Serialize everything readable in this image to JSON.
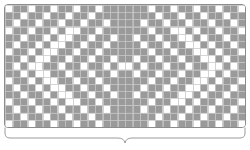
{
  "figure": {
    "kind": "stitch-chart",
    "title": "",
    "caption": "",
    "colors": {
      "filled": "#9a9a9a",
      "empty": "#ffffff",
      "gridline": "#c8c8c8",
      "frame_border": "#8c8c8c",
      "brace": "#9a9a9a"
    }
  },
  "chart_data": {
    "type": "heatmap",
    "title": "",
    "xlabel": "",
    "ylabel": "",
    "columns": 32,
    "rows": 17,
    "legend": [
      {
        "key": "1",
        "label": "filled stitch",
        "color": "#9a9a9a"
      },
      {
        "key": "0",
        "label": "empty stitch",
        "color": "#ffffff"
      }
    ],
    "grid": true,
    "symmetry": "horizontal-mirror-about-center",
    "values": [
      [
        0,
        1,
        1,
        0,
        1,
        1,
        0,
        1,
        1,
        0,
        1,
        1,
        0,
        1,
        1,
        1,
        1,
        1,
        1,
        0,
        1,
        1,
        0,
        1,
        1,
        0,
        1,
        1,
        0,
        1,
        1,
        0
      ],
      [
        1,
        1,
        0,
        1,
        1,
        0,
        1,
        1,
        0,
        1,
        1,
        0,
        1,
        1,
        1,
        1,
        1,
        1,
        1,
        1,
        0,
        1,
        1,
        0,
        1,
        1,
        0,
        1,
        1,
        0,
        1,
        1
      ],
      [
        1,
        0,
        1,
        1,
        0,
        1,
        1,
        0,
        1,
        1,
        0,
        1,
        1,
        0,
        1,
        1,
        1,
        1,
        0,
        1,
        1,
        0,
        1,
        1,
        0,
        1,
        1,
        0,
        1,
        1,
        0,
        1
      ],
      [
        0,
        1,
        1,
        0,
        1,
        1,
        0,
        1,
        0,
        0,
        1,
        1,
        0,
        1,
        1,
        1,
        1,
        1,
        1,
        0,
        1,
        1,
        0,
        0,
        1,
        0,
        1,
        1,
        0,
        1,
        1,
        0
      ],
      [
        1,
        1,
        0,
        1,
        1,
        0,
        1,
        0,
        0,
        1,
        1,
        0,
        1,
        1,
        0,
        1,
        1,
        0,
        1,
        1,
        0,
        1,
        1,
        0,
        0,
        1,
        0,
        1,
        1,
        0,
        1,
        1
      ],
      [
        1,
        0,
        1,
        1,
        0,
        1,
        0,
        0,
        1,
        1,
        0,
        1,
        1,
        0,
        1,
        1,
        1,
        1,
        0,
        1,
        1,
        0,
        1,
        1,
        0,
        0,
        1,
        0,
        1,
        1,
        0,
        1
      ],
      [
        0,
        1,
        1,
        0,
        1,
        0,
        0,
        1,
        1,
        0,
        1,
        1,
        0,
        1,
        1,
        1,
        1,
        1,
        1,
        0,
        1,
        1,
        0,
        1,
        1,
        0,
        0,
        1,
        0,
        1,
        1,
        0
      ],
      [
        1,
        1,
        0,
        1,
        0,
        0,
        1,
        1,
        0,
        1,
        1,
        0,
        1,
        1,
        0,
        1,
        1,
        0,
        1,
        1,
        0,
        1,
        1,
        0,
        1,
        1,
        0,
        0,
        1,
        0,
        1,
        1
      ],
      [
        1,
        0,
        1,
        0,
        0,
        1,
        1,
        0,
        1,
        1,
        0,
        1,
        1,
        0,
        1,
        0,
        0,
        1,
        0,
        1,
        1,
        0,
        1,
        1,
        0,
        1,
        1,
        0,
        0,
        1,
        0,
        1
      ],
      [
        1,
        1,
        0,
        1,
        0,
        0,
        1,
        1,
        0,
        1,
        1,
        0,
        1,
        1,
        0,
        1,
        1,
        0,
        1,
        1,
        0,
        1,
        1,
        0,
        1,
        1,
        0,
        0,
        1,
        0,
        1,
        1
      ],
      [
        0,
        1,
        1,
        0,
        1,
        0,
        0,
        1,
        1,
        0,
        1,
        1,
        0,
        1,
        1,
        1,
        1,
        1,
        1,
        0,
        1,
        1,
        0,
        1,
        1,
        0,
        0,
        1,
        0,
        1,
        1,
        0
      ],
      [
        1,
        0,
        1,
        1,
        0,
        1,
        0,
        0,
        1,
        1,
        0,
        1,
        1,
        0,
        1,
        1,
        1,
        1,
        0,
        1,
        1,
        0,
        1,
        1,
        0,
        0,
        1,
        0,
        1,
        1,
        0,
        1
      ],
      [
        1,
        1,
        0,
        1,
        1,
        0,
        1,
        0,
        0,
        1,
        1,
        0,
        1,
        1,
        0,
        1,
        1,
        0,
        1,
        1,
        0,
        1,
        1,
        0,
        0,
        1,
        0,
        1,
        1,
        0,
        1,
        1
      ],
      [
        0,
        1,
        1,
        0,
        1,
        1,
        0,
        1,
        0,
        0,
        1,
        1,
        0,
        1,
        1,
        1,
        1,
        1,
        1,
        0,
        1,
        1,
        0,
        0,
        1,
        0,
        1,
        1,
        0,
        1,
        1,
        0
      ],
      [
        1,
        0,
        1,
        1,
        0,
        1,
        1,
        0,
        1,
        1,
        0,
        1,
        1,
        0,
        1,
        1,
        1,
        1,
        0,
        1,
        1,
        0,
        1,
        1,
        0,
        1,
        1,
        0,
        1,
        1,
        0,
        1
      ],
      [
        1,
        1,
        0,
        1,
        1,
        0,
        1,
        1,
        0,
        1,
        1,
        0,
        1,
        1,
        1,
        1,
        1,
        1,
        1,
        1,
        0,
        1,
        1,
        0,
        1,
        1,
        0,
        1,
        1,
        0,
        1,
        1
      ],
      [
        0,
        1,
        1,
        0,
        1,
        1,
        0,
        1,
        1,
        0,
        1,
        1,
        0,
        1,
        1,
        1,
        1,
        1,
        1,
        0,
        1,
        1,
        0,
        1,
        1,
        0,
        1,
        1,
        0,
        1,
        1,
        0
      ]
    ]
  },
  "brace": {
    "label": "",
    "span_description": "full chart width",
    "orientation": "down"
  }
}
